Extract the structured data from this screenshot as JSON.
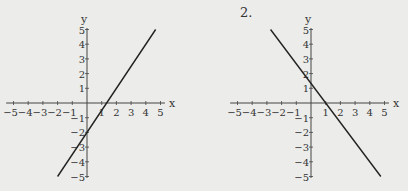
{
  "chart_data": [
    {
      "type": "line",
      "title": "",
      "xlabel": "x",
      "ylabel": "y",
      "xlim": [
        -5,
        5
      ],
      "ylim": [
        -5,
        5
      ],
      "xticks": [
        "-5",
        "-4",
        "-3",
        "-2",
        "-1",
        "1",
        "2",
        "3",
        "4",
        "5"
      ],
      "yticks": [
        "5",
        "4",
        "3",
        "2",
        "1",
        "-1",
        "-2",
        "-3",
        "-4",
        "-5"
      ],
      "equation": "y = 1.5x - 2",
      "series": [
        {
          "name": "line 1",
          "x": [
            -2,
            4.67
          ],
          "y": [
            -5,
            5
          ]
        }
      ],
      "origin_px": [
        87,
        103
      ],
      "unit_px": 14.7
    },
    {
      "type": "line",
      "title": "2.",
      "xlabel": "x",
      "ylabel": "y",
      "xlim": [
        -5,
        5
      ],
      "ylim": [
        -5,
        5
      ],
      "xticks": [
        "-5",
        "-4",
        "-3",
        "-2",
        "-1",
        "1",
        "2",
        "3",
        "4",
        "5"
      ],
      "yticks": [
        "5",
        "4",
        "3",
        "2",
        "1",
        "-1",
        "-2",
        "-3",
        "-4",
        "-5"
      ],
      "equation": "y = -4/3 x + 4/3",
      "series": [
        {
          "name": "line 2",
          "x": [
            -2.75,
            4.75
          ],
          "y": [
            5,
            -5
          ]
        }
      ],
      "origin_px": [
        311,
        103
      ],
      "unit_px": 14.7
    }
  ],
  "labels": {
    "problem_number": "2."
  }
}
